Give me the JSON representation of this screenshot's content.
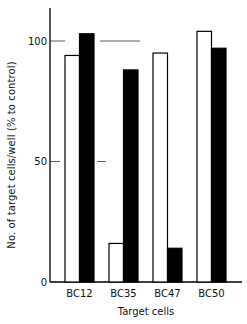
{
  "chart_data": {
    "type": "bar",
    "title": "",
    "xlabel": "Target cells",
    "ylabel": "No. of target cells/well (% to control)",
    "categories": [
      "BC12",
      "BC35",
      "BC47",
      "BC50"
    ],
    "series": [
      {
        "name": "open bars",
        "fill": "#ffffff",
        "values": [
          94,
          16,
          95,
          104
        ]
      },
      {
        "name": "filled bars",
        "fill": "#000000",
        "values": [
          103,
          88,
          14,
          97
        ]
      }
    ],
    "yticks": [
      0,
      50,
      100
    ],
    "ytick_labels": [
      "0",
      "50",
      "100"
    ],
    "ylim": [
      0,
      115
    ],
    "grid": false,
    "legend": "none",
    "reference_lines": [
      {
        "y": 100,
        "segments": [
          [
            50,
            65
          ],
          [
            100,
            140
          ]
        ]
      },
      {
        "y": 50,
        "segments": [
          [
            50,
            60
          ],
          [
            97,
            106
          ]
        ]
      }
    ]
  }
}
